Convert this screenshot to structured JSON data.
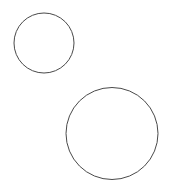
{
  "canvas": {
    "width": 174,
    "height": 194,
    "background_color": "#ffffff",
    "description": "Two unfilled circle outlines on a plain white background"
  },
  "style": {
    "stroke_color": "#4a4a4a",
    "stroke_width": 1,
    "fill": "none"
  },
  "shapes": [
    {
      "id": "small-circle",
      "type": "circle",
      "label": "small circle",
      "center_x": 44,
      "center_y": 43,
      "radius": 30,
      "diameter": 60,
      "stroke_color": "#4a4a4a",
      "stroke_width": 1,
      "fill": "none"
    },
    {
      "id": "large-circle",
      "type": "circle",
      "label": "large circle",
      "center_x": 112,
      "center_y": 133.5,
      "radius": 46,
      "diameter": 92,
      "stroke_color": "#4a4a4a",
      "stroke_width": 1,
      "fill": "none"
    }
  ]
}
